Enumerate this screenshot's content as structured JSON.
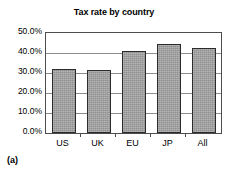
{
  "caption": "(a)",
  "chart_data": {
    "type": "bar",
    "title": "Tax rate by country",
    "xlabel": "",
    "ylabel": "",
    "categories": [
      "US",
      "UK",
      "EU",
      "JP",
      "All"
    ],
    "values": [
      32.0,
      31.5,
      41.0,
      44.5,
      42.3
    ],
    "value_labels": [
      "32.0%",
      "31.5%",
      "41.0%",
      "44.5%",
      "42.3%"
    ],
    "ylim": [
      0,
      50
    ],
    "ytick_values": [
      0,
      10,
      20,
      30,
      40,
      50
    ],
    "ytick_labels": [
      "0.0%",
      "10.0%",
      "20.0%",
      "30.0%",
      "40.0%",
      "50.0%"
    ],
    "grid": "horizontal",
    "legend": "none",
    "bar_color": "#9e9e9e",
    "bar_edge_color": "#2b2b2b",
    "axis_color": "#4d4d4d",
    "gridline_color": "#8c8c8c"
  }
}
